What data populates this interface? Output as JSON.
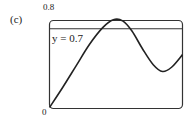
{
  "panel_label": "(c)",
  "chart_data": {
    "type": "line",
    "title": "",
    "xlabel": "",
    "ylabel": "",
    "ylim": [
      0,
      0.8
    ],
    "ytick_labels": [
      "0",
      "0.8"
    ],
    "grid": false,
    "annotations": [
      {
        "text": "y = 0.7",
        "type": "horizontal_line",
        "y": 0.7
      }
    ],
    "series": [
      {
        "name": "curve",
        "x": [
          0,
          0.1,
          0.2,
          0.3,
          0.4,
          0.48,
          0.55,
          0.62,
          0.7,
          0.78,
          0.85,
          0.92,
          1.0
        ],
        "values": [
          0,
          0.18,
          0.37,
          0.56,
          0.71,
          0.78,
          0.77,
          0.68,
          0.52,
          0.38,
          0.32,
          0.36,
          0.47
        ]
      }
    ]
  },
  "labels": {
    "ymax": "0.8",
    "ymin": "0",
    "hline": "y = 0.7"
  }
}
